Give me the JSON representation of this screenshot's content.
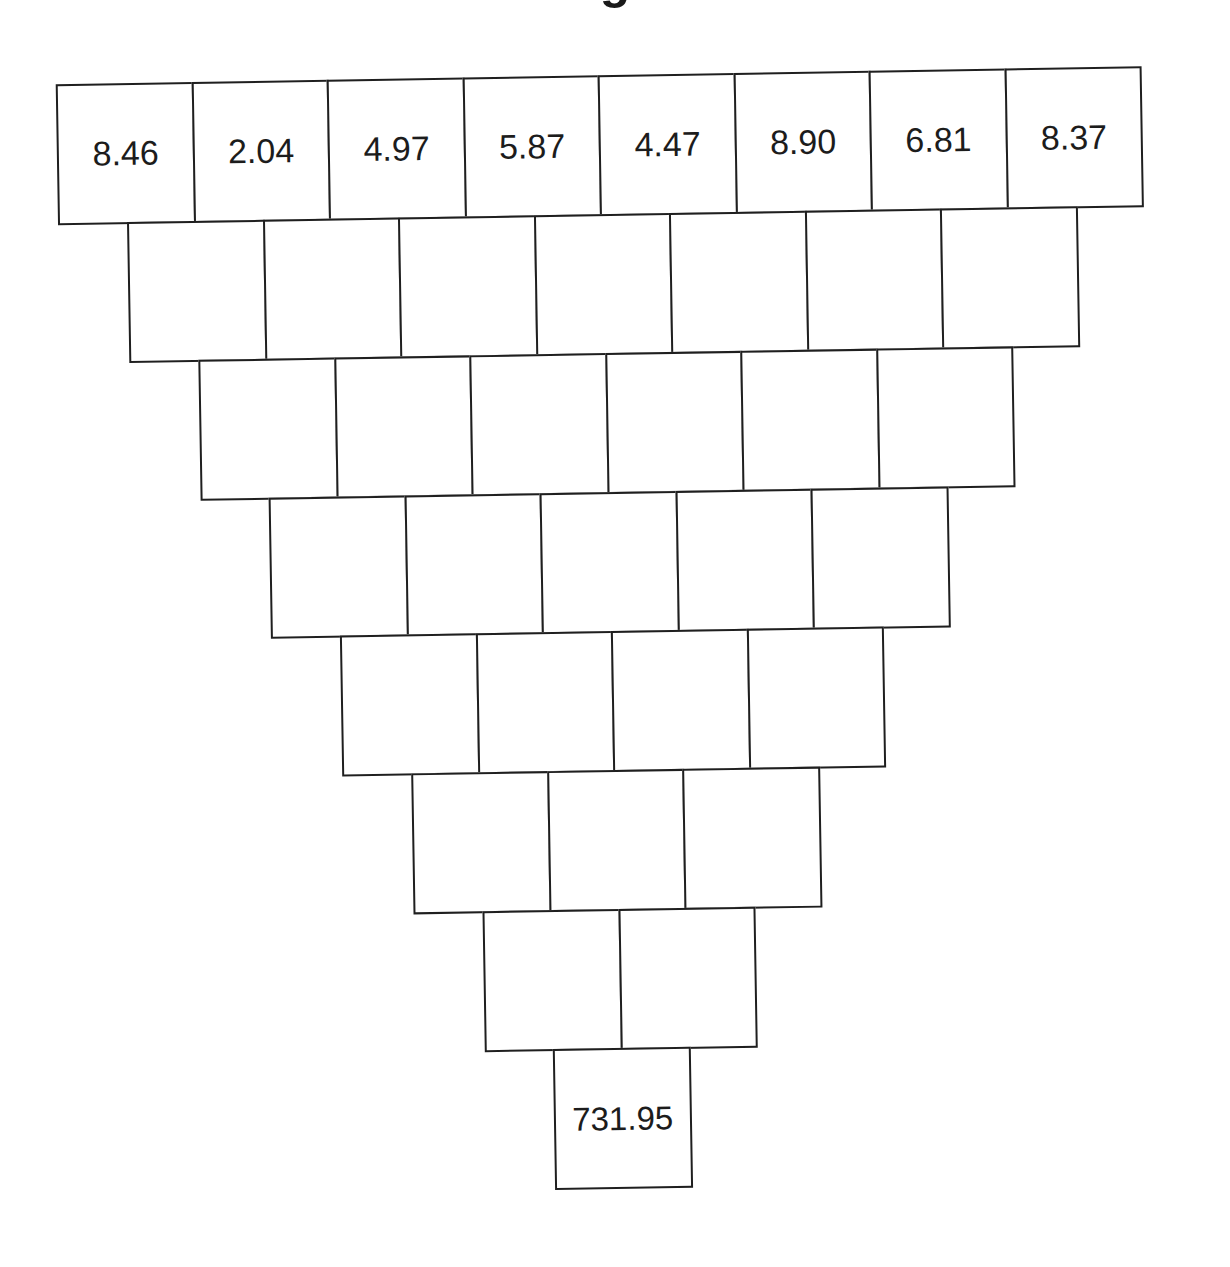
{
  "worksheet": {
    "title_partial": "g",
    "pyramid": {
      "orientation": "inverted",
      "row_sizes": [
        8,
        7,
        6,
        5,
        4,
        3,
        2,
        1
      ],
      "rows": [
        {
          "cells": [
            "8.46",
            "2.04",
            "4.97",
            "5.87",
            "4.47",
            "8.90",
            "6.81",
            "8.37"
          ]
        },
        {
          "cells": [
            "",
            "",
            "",
            "",
            "",
            "",
            ""
          ]
        },
        {
          "cells": [
            "",
            "",
            "",
            "",
            "",
            ""
          ]
        },
        {
          "cells": [
            "",
            "",
            "",
            "",
            ""
          ]
        },
        {
          "cells": [
            "",
            "",
            "",
            ""
          ]
        },
        {
          "cells": [
            "",
            "",
            ""
          ]
        },
        {
          "cells": [
            "",
            ""
          ]
        },
        {
          "cells": [
            "731.95"
          ]
        }
      ]
    }
  },
  "style": {
    "line_color": "#1f1f1f",
    "text_color": "#1c1c1c",
    "background": "#ffffff"
  }
}
